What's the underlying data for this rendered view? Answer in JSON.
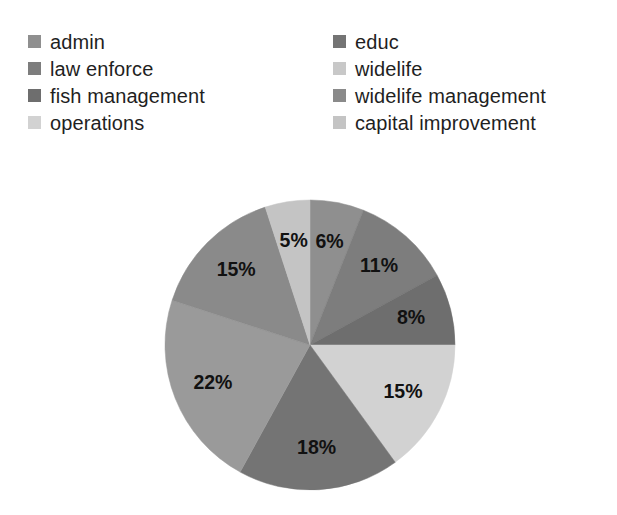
{
  "chart_data": {
    "type": "pie",
    "title": "",
    "subtitle": "",
    "xlabel": "",
    "ylabel": "",
    "grid": false,
    "legend_position": "top",
    "legend_columns": 2,
    "value_suffix": "%",
    "start_angle_deg": 0,
    "direction": "clockwise",
    "categories": [
      "admin",
      "law enforce",
      "fish management",
      "operations",
      "educ",
      "widelife",
      "widelife management",
      "capital improvement"
    ],
    "values": [
      6,
      11,
      8,
      15,
      18,
      22,
      15,
      5
    ],
    "labels": [
      "6%",
      "11%",
      "8%",
      "15%",
      "18%",
      "22%",
      "15%",
      "5%"
    ],
    "colors": [
      "#8f8f8f",
      "#7d7d7d",
      "#6e6e6e",
      "#d2d2d2",
      "#747474",
      "#9a9a9a",
      "#8a8a8a",
      "#c4c4c4"
    ],
    "slices": [
      {
        "name": "admin",
        "value": 6,
        "label": "6%",
        "color": "#8f8f8f"
      },
      {
        "name": "law enforce",
        "value": 11,
        "label": "11%",
        "color": "#7d7d7d"
      },
      {
        "name": "fish management",
        "value": 8,
        "label": "8%",
        "color": "#6e6e6e"
      },
      {
        "name": "operations",
        "value": 15,
        "label": "15%",
        "color": "#d2d2d2"
      },
      {
        "name": "educ",
        "value": 18,
        "label": "18%",
        "color": "#747474"
      },
      {
        "name": "widelife",
        "value": 22,
        "label": "22%",
        "color": "#9a9a9a"
      },
      {
        "name": "widelife management",
        "value": 15,
        "label": "15%",
        "color": "#8a8a8a"
      },
      {
        "name": "capital improvement",
        "value": 5,
        "label": "5%",
        "color": "#c4c4c4"
      }
    ]
  },
  "legend": {
    "left_column": [
      {
        "label": "admin",
        "color": "#8f8f8f"
      },
      {
        "label": "law enforce",
        "color": "#7d7d7d"
      },
      {
        "label": "fish management",
        "color": "#6e6e6e"
      },
      {
        "label": "operations",
        "color": "#d2d2d2"
      }
    ],
    "right_column": [
      {
        "label": "educ",
        "color": "#747474"
      },
      {
        "label": "widelife",
        "color": "#c8c8c8"
      },
      {
        "label": "widelife management",
        "color": "#8a8a8a"
      },
      {
        "label": "capital improvement",
        "color": "#c4c4c4"
      }
    ]
  },
  "geometry": {
    "center_x": 150,
    "center_y": 150,
    "radius": 145,
    "label_radius_ratio": 0.72
  }
}
